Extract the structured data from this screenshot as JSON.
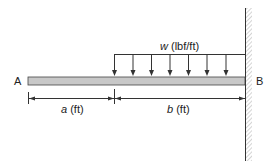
{
  "diagram": {
    "type": "cantilever beam with partial uniformly distributed load",
    "labels": {
      "end_a": "A",
      "end_b": "B",
      "load_var": "w",
      "load_unit": " (lbf/ft)",
      "dim_a_var": "a",
      "dim_a_unit": " (ft)",
      "dim_b_var": "b",
      "dim_b_unit": " (ft)"
    },
    "colors": {
      "beam_fill": "#c8c8c8",
      "line": "#333333",
      "hatch": "#999999"
    },
    "load_arrow_count": 7
  }
}
